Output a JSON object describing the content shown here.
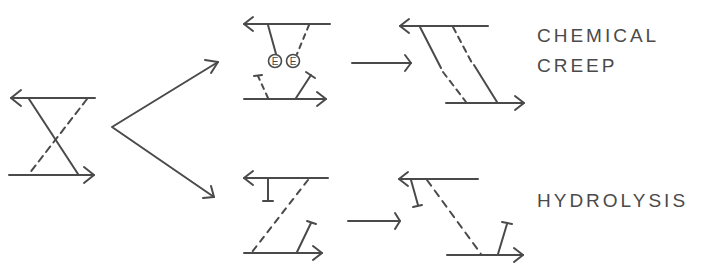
{
  "diagram": {
    "stroke_color": "#4a4a4a",
    "background": "#ffffff",
    "labels": {
      "chemical_line1": "CHEMICAL",
      "chemical_line2": "CREEP",
      "hydrolysis": "HYDROLYSIS"
    },
    "enzyme_symbol": "E",
    "panels": [
      {
        "id": "initial-crosslinked",
        "description": "Two antiparallel strands joined by crossed solid and dashed links"
      },
      {
        "id": "chemical-creep-intermediate",
        "description": "Broken links with two E-labelled enzyme circles"
      },
      {
        "id": "chemical-creep-result",
        "description": "Strands displaced, reconnected by parallel solid and dashed links"
      },
      {
        "id": "hydrolysis-intermediate",
        "description": "Links cleaved, T-terminated stubs remain"
      },
      {
        "id": "hydrolysis-result",
        "description": "Strands displaced with diagonal dashed link and T-terminated stubs"
      }
    ]
  }
}
